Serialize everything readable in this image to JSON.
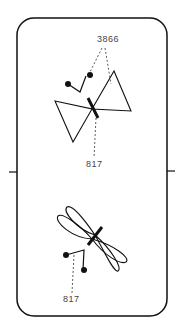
{
  "figure": {
    "type": "patent-drawing",
    "colors": {
      "stroke": "#111111",
      "label": "#444444",
      "background": "#ffffff"
    }
  },
  "labels": {
    "top_ref": "3866",
    "middle_ref": "817",
    "bottom_ref": "817"
  },
  "shapes": [
    {
      "name": "bowtie-triangles",
      "position": "upper"
    },
    {
      "name": "dragonfly-loops",
      "position": "lower"
    }
  ]
}
